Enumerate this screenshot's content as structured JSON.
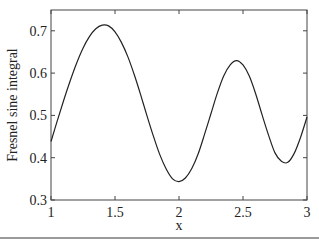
{
  "chart_data": {
    "type": "line",
    "title": "",
    "xlabel": "x",
    "ylabel": "Fresnel sine integral",
    "xlim": [
      1,
      3
    ],
    "ylim": [
      0.3,
      0.75
    ],
    "xticks": [
      1,
      1.5,
      2,
      2.5,
      3
    ],
    "xtick_labels": [
      "1",
      "1.5",
      "2",
      "2.5",
      "3"
    ],
    "yticks": [
      0.3,
      0.4,
      0.5,
      0.6,
      0.7
    ],
    "ytick_labels": [
      "0.3",
      "0.4",
      "0.5",
      "0.6",
      "0.7"
    ],
    "grid": false,
    "legend": null,
    "series": [
      {
        "name": "Fresnel sine integral S(x)",
        "color": "#222222",
        "x": [
          1.0,
          1.05,
          1.1,
          1.15,
          1.2,
          1.25,
          1.3,
          1.35,
          1.4,
          1.45,
          1.5,
          1.55,
          1.6,
          1.65,
          1.7,
          1.75,
          1.8,
          1.85,
          1.9,
          1.95,
          2.0,
          2.05,
          2.1,
          2.15,
          2.2,
          2.25,
          2.3,
          2.35,
          2.4,
          2.45,
          2.5,
          2.55,
          2.6,
          2.65,
          2.7,
          2.75,
          2.8,
          2.85,
          2.9,
          2.95,
          3.0
        ],
        "y": [
          0.4383,
          0.4881,
          0.5365,
          0.5819,
          0.6234,
          0.6589,
          0.6863,
          0.7049,
          0.7135,
          0.7117,
          0.6975,
          0.6727,
          0.6389,
          0.5966,
          0.5492,
          0.499,
          0.4509,
          0.4072,
          0.3733,
          0.35,
          0.3434,
          0.3521,
          0.3743,
          0.4093,
          0.4557,
          0.5045,
          0.5532,
          0.5939,
          0.6197,
          0.6297,
          0.6192,
          0.5923,
          0.55,
          0.5005,
          0.4529,
          0.4114,
          0.3915,
          0.389,
          0.4102,
          0.4484,
          0.4963
        ]
      }
    ]
  }
}
